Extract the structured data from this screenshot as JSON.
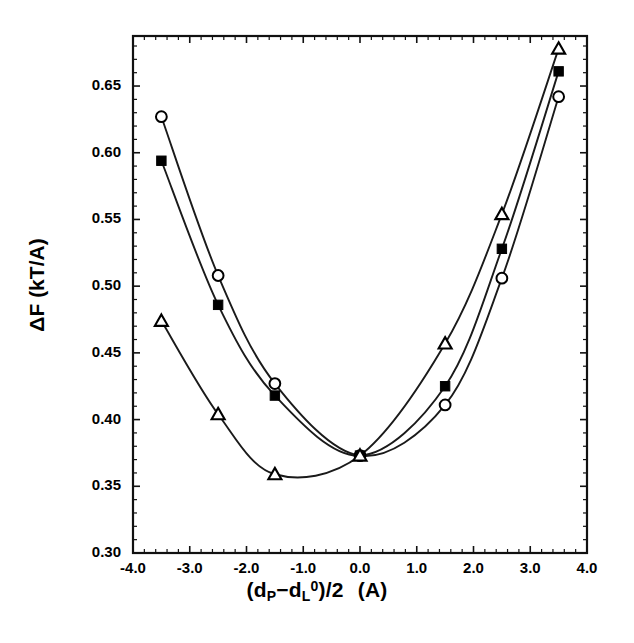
{
  "chart_data": {
    "type": "line",
    "title": "",
    "xlabel": "(dP−dL0)/2  (A)",
    "xlabel_parts": {
      "open_paren": "(d",
      "sub_p": "P",
      "minus": "−",
      "d_l": "d",
      "sub_l": "L",
      "sup_zero": "0",
      "close": ")/2",
      "unit": "(A)"
    },
    "ylabel": "ΔF  (kT/A)",
    "xlim": [
      -4.0,
      4.0
    ],
    "ylim": [
      0.3,
      0.6875
    ],
    "xticks": [
      -4.0,
      -3.0,
      -2.0,
      -1.0,
      0.0,
      1.0,
      2.0,
      3.0,
      4.0
    ],
    "xticklabels": [
      "-4.0",
      "-3.0",
      "-2.0",
      "-1.0",
      "0.0",
      "1.0",
      "2.0",
      "3.0",
      "4.0"
    ],
    "yticks": [
      0.3,
      0.35,
      0.4,
      0.45,
      0.5,
      0.55,
      0.6,
      0.65
    ],
    "yticklabels": [
      "0.30",
      "0.35",
      "0.40",
      "0.45",
      "0.50",
      "0.55",
      "0.60",
      "0.65"
    ],
    "minor_ticks_per_interval": 4,
    "grid": false,
    "legend": "none",
    "frame": true,
    "line_color": "#1a1a1a",
    "marker_color": "#000000",
    "series": [
      {
        "name": "open-circle-series",
        "marker": "circle-open",
        "x": [
          -3.5,
          -2.5,
          -1.5,
          0.0,
          1.5,
          2.5,
          3.5
        ],
        "values": [
          0.627,
          0.508,
          0.427,
          0.373,
          0.411,
          0.506,
          0.642
        ]
      },
      {
        "name": "filled-square-series",
        "marker": "square-filled",
        "x": [
          -3.5,
          -2.5,
          -1.5,
          0.0,
          1.5,
          2.5,
          3.5
        ],
        "values": [
          0.594,
          0.486,
          0.418,
          0.373,
          0.425,
          0.528,
          0.661
        ]
      },
      {
        "name": "open-triangle-series",
        "marker": "triangle-open",
        "x": [
          -3.5,
          -2.5,
          -1.5,
          0.0,
          1.5,
          2.5,
          3.5
        ],
        "values": [
          0.474,
          0.404,
          0.359,
          0.373,
          0.457,
          0.554,
          0.678
        ]
      }
    ]
  },
  "figure": {
    "plot_area": {
      "left": 133,
      "right": 587,
      "top": 36,
      "bottom": 553
    }
  }
}
